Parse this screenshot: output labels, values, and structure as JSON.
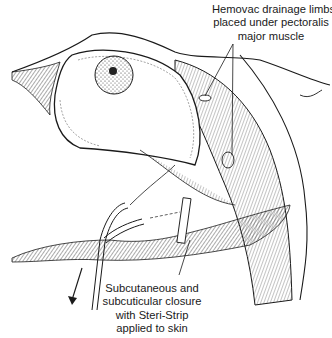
{
  "figure": {
    "type": "surgical illustration"
  },
  "annotations": {
    "hemovac": {
      "lines": [
        "Hemovac drainage limbs",
        "placed under pectoralis",
        "major muscle"
      ]
    },
    "closure": {
      "lines": [
        "Subcutaneous and",
        "subcuticular closure",
        "with Steri-Strip",
        "applied to skin"
      ]
    }
  },
  "colors": {
    "ink": "#1a1a1a",
    "background": "#ffffff",
    "hatch": "#555555"
  }
}
